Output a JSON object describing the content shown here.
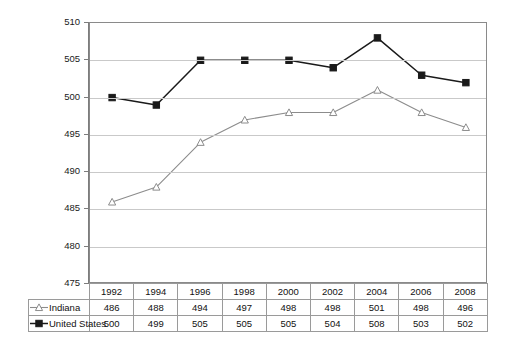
{
  "chart_data": {
    "type": "line",
    "title": "",
    "xlabel": "",
    "ylabel": "",
    "categories": [
      "1992",
      "1994",
      "1996",
      "1998",
      "2000",
      "2002",
      "2004",
      "2006",
      "2008"
    ],
    "ylim": [
      475,
      510
    ],
    "y_ticks": [
      475,
      480,
      485,
      490,
      495,
      500,
      505,
      510
    ],
    "grid": true,
    "legend_position": "table-row-headers",
    "series": [
      {
        "name": "Indiana",
        "values": [
          486,
          488,
          494,
          497,
          498,
          498,
          501,
          498,
          496
        ],
        "color": "#8c8c8c",
        "marker": "open-triangle"
      },
      {
        "name": "United States",
        "values": [
          500,
          499,
          505,
          505,
          505,
          504,
          508,
          503,
          502
        ],
        "color": "#1a1a1a",
        "marker": "filled-square"
      }
    ]
  },
  "axis": {
    "y_tick_labels": [
      "510",
      "505",
      "500",
      "495",
      "490",
      "485",
      "480",
      "475"
    ]
  },
  "table": {
    "header_row": [
      "1992",
      "1994",
      "1996",
      "1998",
      "2000",
      "2002",
      "2004",
      "2006",
      "2008"
    ],
    "rows": [
      {
        "label": "Indiana",
        "marker_icon": "open-triangle-marker-icon",
        "values": [
          "486",
          "488",
          "494",
          "497",
          "498",
          "498",
          "501",
          "498",
          "496"
        ]
      },
      {
        "label": "United States",
        "marker_icon": "filled-square-marker-icon",
        "values": [
          "500",
          "499",
          "505",
          "505",
          "505",
          "504",
          "508",
          "503",
          "502"
        ]
      }
    ]
  },
  "colors": {
    "indiana_line": "#8c8c8c",
    "united_states_line": "#1a1a1a",
    "gridline": "#c9c9c9",
    "axis": "#7d7d7d",
    "table_border": "#9a9a9a"
  }
}
